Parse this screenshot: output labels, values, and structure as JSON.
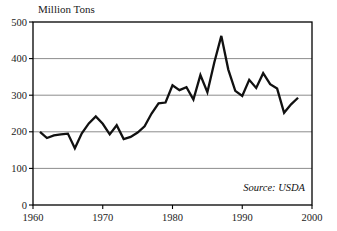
{
  "chart_data": {
    "type": "line",
    "title": "Million Tons",
    "xlabel": "",
    "ylabel": "Million Tons",
    "xlim": [
      1960,
      2000
    ],
    "ylim": [
      0,
      500
    ],
    "grid": true,
    "legend": false,
    "annotation": "Source: USDA",
    "yticks": [
      0,
      100,
      200,
      300,
      400,
      500
    ],
    "ytick_labels": [
      "0",
      "100",
      "200",
      "300",
      "400",
      "500"
    ],
    "xticks": [
      1960,
      1970,
      1980,
      1990,
      2000
    ],
    "xtick_labels": [
      "1960",
      "1970",
      "1980",
      "1990",
      "2000"
    ],
    "line_color": "#111111",
    "grid_color": "#808080",
    "x": [
      1961,
      1962,
      1963,
      1964,
      1965,
      1966,
      1967,
      1968,
      1969,
      1970,
      1971,
      1972,
      1973,
      1974,
      1975,
      1976,
      1977,
      1978,
      1979,
      1980,
      1981,
      1982,
      1983,
      1984,
      1985,
      1986,
      1987,
      1988,
      1989,
      1990,
      1991,
      1992,
      1993,
      1994,
      1995,
      1996,
      1997,
      1998
    ],
    "series": [
      {
        "name": "Million Tons",
        "values": [
          200,
          183,
          190,
          193,
          195,
          155,
          196,
          223,
          242,
          222,
          193,
          218,
          180,
          186,
          198,
          215,
          250,
          278,
          280,
          327,
          314,
          322,
          288,
          355,
          308,
          390,
          462,
          370,
          312,
          298,
          342,
          320,
          360,
          330,
          318,
          252,
          275,
          293
        ]
      }
    ]
  }
}
